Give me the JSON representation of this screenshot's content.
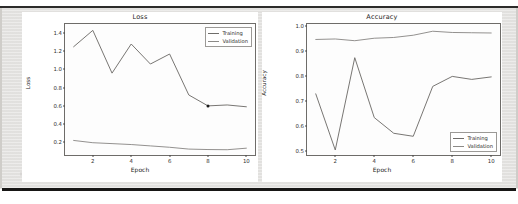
{
  "document": {
    "kind": "scanned-figure-page",
    "background_color": "#e6e5e3",
    "rule_color": "#171615"
  },
  "figure": {
    "panels": [
      "loss",
      "accuracy"
    ]
  },
  "chart_data": [
    {
      "id": "loss",
      "type": "line",
      "title": "Loss",
      "xlabel": "Epoch",
      "ylabel": "Loss",
      "x": [
        1,
        2,
        3,
        4,
        5,
        6,
        7,
        8,
        9,
        10
      ],
      "xlim": [
        0.55,
        10.45
      ],
      "ylim": [
        0.06,
        1.5
      ],
      "xticks": [
        2,
        4,
        6,
        8,
        10
      ],
      "xticklabels": [
        "2",
        "4",
        "6",
        "8",
        "10"
      ],
      "yticks": [
        0.2,
        0.4,
        0.6,
        0.8,
        1.0,
        1.2,
        1.4
      ],
      "yticklabels": [
        "0.2",
        "0.4",
        "0.6",
        "0.8",
        "1.0",
        "1.2",
        "1.4"
      ],
      "grid": false,
      "legend_position": "upper right",
      "series": [
        {
          "name": "Training",
          "color": "#6f6d6a",
          "values": [
            1.25,
            1.43,
            0.96,
            1.28,
            1.06,
            1.17,
            0.72,
            0.6,
            0.61,
            0.59
          ]
        },
        {
          "name": "Validation",
          "color": "#8c8a87",
          "values": [
            0.22,
            0.195,
            0.185,
            0.175,
            0.16,
            0.145,
            0.125,
            0.12,
            0.118,
            0.135
          ]
        }
      ],
      "annotations": [
        {
          "name": "marker-dot",
          "x": 8,
          "y": 0.6
        }
      ]
    },
    {
      "id": "accuracy",
      "type": "line",
      "title": "Accuracy",
      "xlabel": "Epoch",
      "ylabel": "Accuracy",
      "x": [
        1,
        2,
        3,
        4,
        5,
        6,
        7,
        8,
        9,
        10
      ],
      "xlim": [
        0.55,
        10.45
      ],
      "ylim": [
        0.485,
        1.01
      ],
      "xticks": [
        2,
        4,
        6,
        8,
        10
      ],
      "xticklabels": [
        "2",
        "4",
        "6",
        "8",
        "10"
      ],
      "yticks": [
        0.5,
        0.6,
        0.7,
        0.8,
        0.9,
        1.0
      ],
      "yticklabels": [
        "0.5",
        "0.6",
        "0.7",
        "0.8",
        "0.9",
        "1.0"
      ],
      "grid": false,
      "legend_position": "lower right",
      "series": [
        {
          "name": "Training",
          "color": "#6f6d6a",
          "values": [
            0.73,
            0.505,
            0.875,
            0.635,
            0.572,
            0.56,
            0.76,
            0.8,
            0.788,
            0.798
          ]
        },
        {
          "name": "Validation",
          "color": "#8c8a87",
          "values": [
            0.948,
            0.95,
            0.943,
            0.953,
            0.956,
            0.965,
            0.981,
            0.976,
            0.975,
            0.974
          ]
        }
      ]
    }
  ]
}
